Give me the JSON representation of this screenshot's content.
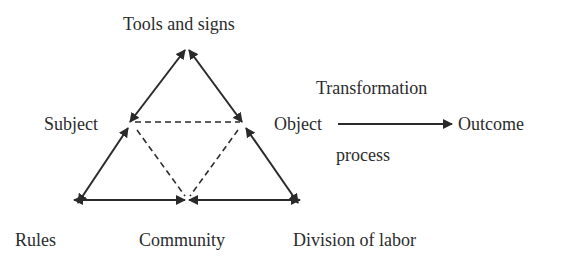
{
  "diagram": {
    "nodes": {
      "tools": {
        "label": "Tools and signs"
      },
      "subject": {
        "label": "Subject"
      },
      "object": {
        "label": "Object"
      },
      "outcome": {
        "label": "Outcome"
      },
      "rules": {
        "label": "Rules"
      },
      "community": {
        "label": "Community"
      },
      "division": {
        "label": "Division of labor"
      }
    },
    "transformation_label_top": "Transformation",
    "transformation_label_bottom": "process",
    "edges": [
      {
        "from": "subject",
        "to": "tools",
        "style": "solid",
        "arrows": "both"
      },
      {
        "from": "tools",
        "to": "object",
        "style": "solid",
        "arrows": "both"
      },
      {
        "from": "subject",
        "to": "rules",
        "style": "solid",
        "arrows": "both"
      },
      {
        "from": "object",
        "to": "division",
        "style": "solid",
        "arrows": "both"
      },
      {
        "from": "rules",
        "to": "community",
        "style": "solid",
        "arrows": "both"
      },
      {
        "from": "community",
        "to": "division",
        "style": "solid",
        "arrows": "both"
      },
      {
        "from": "subject",
        "to": "object",
        "style": "dashed",
        "arrows": "none"
      },
      {
        "from": "subject",
        "to": "community",
        "style": "dashed",
        "arrows": "none"
      },
      {
        "from": "object",
        "to": "community",
        "style": "dashed",
        "arrows": "none"
      },
      {
        "from": "object",
        "to": "outcome",
        "style": "solid",
        "arrows": "forward"
      }
    ],
    "colors": {
      "line": "#2a2a2a",
      "text": "#2b2b2b",
      "background": "#ffffff"
    }
  }
}
